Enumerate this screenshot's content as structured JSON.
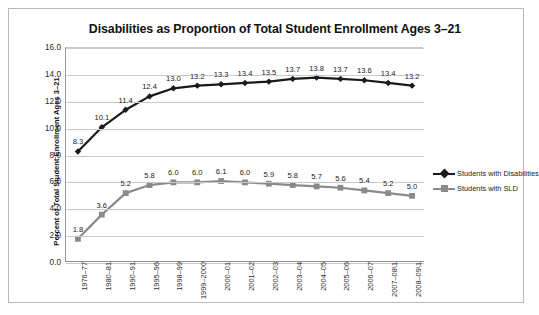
{
  "chart_data": {
    "type": "line",
    "title": "Disabilities as Proportion of Total Student Enrollment Ages 3–21",
    "xlabel": "",
    "ylabel": "Percent of Total Student Enrollment Ages 3–21",
    "ylim": [
      0.0,
      16.0
    ],
    "ytick_step": 2.0,
    "ytick_labels": [
      "0.0",
      "2.0",
      "4.0",
      "6.0",
      "8.0",
      "10.0",
      "12.0",
      "14.0",
      "16.0"
    ],
    "grid": true,
    "legend_position": "right",
    "categories": [
      "1976–77",
      "1980–81",
      "1990–91",
      "1995–96",
      "1998–99",
      "1999–2000",
      "2000–01",
      "2001–02",
      "2002–03",
      "2003–04",
      "2004–05",
      "2005–06",
      "2006–07",
      "2007–08\\1",
      "2008–09\\1"
    ],
    "series": [
      {
        "name": "Students with Disabilities",
        "color": "#1a1a1a",
        "marker": "diamond",
        "values": [
          8.3,
          10.1,
          11.4,
          12.4,
          13.0,
          13.2,
          13.3,
          13.4,
          13.5,
          13.7,
          13.8,
          13.7,
          13.6,
          13.4,
          13.2
        ],
        "labels": [
          "8.3",
          "10.1",
          "11.4",
          "12.4",
          "13.0",
          "13.2",
          "13.3",
          "13.4",
          "13.5",
          "13.7",
          "13.8",
          "13.7",
          "13.6",
          "13.4",
          "13.2"
        ]
      },
      {
        "name": "Students with SLD",
        "color": "#8a8a8a",
        "marker": "square",
        "values": [
          1.8,
          3.6,
          5.2,
          5.8,
          6.0,
          6.0,
          6.1,
          6.0,
          5.9,
          5.8,
          5.7,
          5.6,
          5.4,
          5.2,
          5.0
        ],
        "labels": [
          "1.8",
          "3.6",
          "5.2",
          "5.8",
          "6.0",
          "6.0",
          "6.1",
          "6.0",
          "5.9",
          "5.8",
          "5.7",
          "5.6",
          "5.4",
          "5.2",
          "5.0"
        ]
      }
    ]
  },
  "legend": {
    "items": [
      {
        "label": "Students with Disabilities"
      },
      {
        "label": "Students with SLD"
      }
    ]
  },
  "colors": {
    "disabilities": "#1a1a1a",
    "sld": "#8a8a8a",
    "gridline": "#c9c9c9",
    "frame": "#b9b9b9"
  }
}
